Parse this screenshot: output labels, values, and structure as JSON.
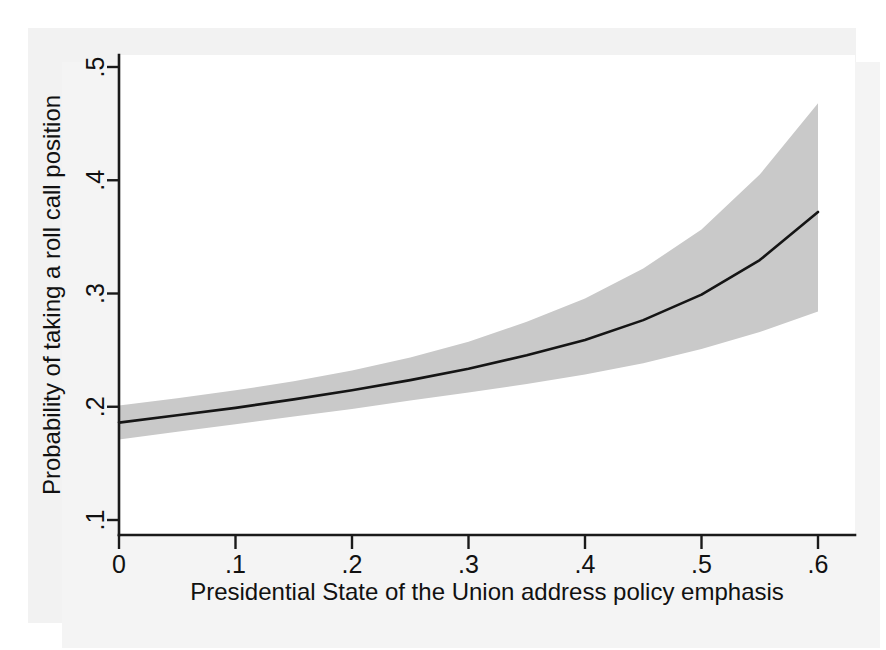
{
  "figure": {
    "kind": "statistical-marginal-effects-plot",
    "background_color": "#f2f2f2",
    "plot_background_color": "#ffffff",
    "band_color": "#c9c9c9",
    "line_color": "#151515",
    "axis_color": "#1a1a1a"
  },
  "chart_data": {
    "type": "line",
    "title": "",
    "subtitle": "",
    "xlabel": "Presidential State of the Union address policy emphasis",
    "ylabel": "Probability of taking a roll call position",
    "xlim": [
      0,
      0.6
    ],
    "ylim": [
      0.1,
      0.5
    ],
    "xticks": [
      0,
      0.1,
      0.2,
      0.3,
      0.4,
      0.5,
      0.6
    ],
    "xticklabels": [
      "0",
      ".1",
      ".2",
      ".3",
      ".4",
      ".5",
      ".6"
    ],
    "yticks": [
      0.1,
      0.2,
      0.3,
      0.4,
      0.5
    ],
    "yticklabels": [
      ".1",
      ".2",
      ".3",
      ".4",
      ".5"
    ],
    "grid": false,
    "legend": null,
    "legend_position": "none",
    "x": [
      0,
      0.05,
      0.1,
      0.15,
      0.2,
      0.25,
      0.3,
      0.35,
      0.4,
      0.45,
      0.5,
      0.55,
      0.6
    ],
    "series": [
      {
        "name": "Predicted probability",
        "role": "fit",
        "values": [
          0.186,
          0.1925,
          0.199,
          0.2065,
          0.2145,
          0.2235,
          0.2335,
          0.2455,
          0.259,
          0.2765,
          0.299,
          0.3295,
          0.372
        ]
      },
      {
        "name": "95% confidence interval upper bound",
        "role": "ci_upper",
        "values": [
          0.201,
          0.2075,
          0.2145,
          0.2225,
          0.232,
          0.2435,
          0.2575,
          0.275,
          0.2955,
          0.322,
          0.3565,
          0.405,
          0.468
        ]
      },
      {
        "name": "95% confidence interval lower bound",
        "role": "ci_lower",
        "values": [
          0.171,
          0.178,
          0.1845,
          0.1915,
          0.198,
          0.2055,
          0.2125,
          0.22,
          0.2285,
          0.2385,
          0.251,
          0.266,
          0.284
        ]
      }
    ]
  }
}
